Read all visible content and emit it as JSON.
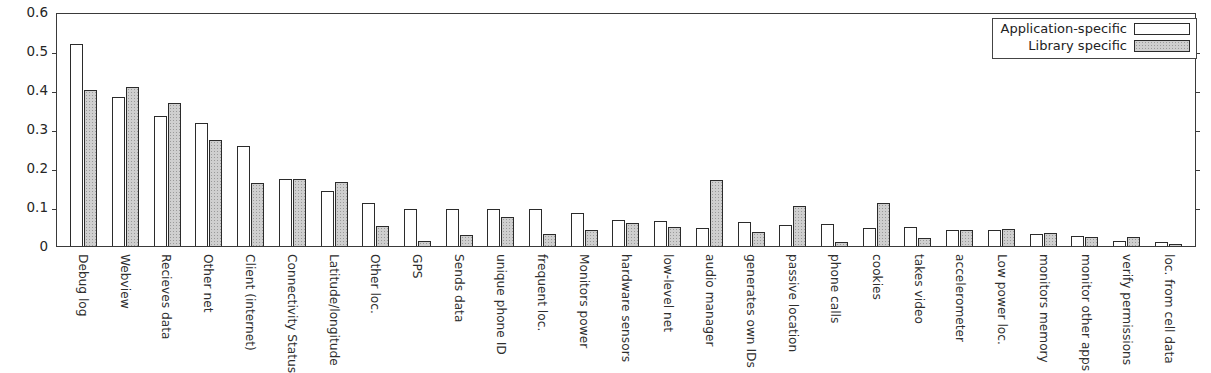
{
  "chart_data": {
    "type": "bar",
    "title": "",
    "subtitle": "",
    "xlabel": "",
    "ylabel": "",
    "ylim": [
      0,
      0.6
    ],
    "yticks": [
      "0",
      "0.1",
      "0.2",
      "0.3",
      "0.4",
      "0.5",
      "0.6"
    ],
    "ytick_values": [
      0,
      0.1,
      0.2,
      0.3,
      0.4,
      0.5,
      0.6
    ],
    "grid": false,
    "legend_position": "upper-right",
    "categories": [
      "Debug log",
      "Webview",
      "Recieves data",
      "Other net",
      "Client (internet)",
      "Connectivity Status",
      "Latitude/longitude",
      "Other loc.",
      "GPS",
      "Sends data",
      "unique phone ID",
      "frequent loc.",
      "Monitors power",
      "hardware sensors",
      "low-level net",
      "audio manager",
      "generates own IDs",
      "passive location",
      "phone calls",
      "cookies",
      "takes video",
      "accelerometer",
      "Low power loc.",
      "monitors memory",
      "monitor other apps",
      "verify permissions",
      "loc. from cell data"
    ],
    "series": [
      {
        "name": "Application-specific",
        "color": "#ffffff",
        "values": [
          0.517,
          0.383,
          0.334,
          0.315,
          0.256,
          0.172,
          0.141,
          0.111,
          0.096,
          0.095,
          0.094,
          0.094,
          0.085,
          0.067,
          0.064,
          0.047,
          0.062,
          0.053,
          0.056,
          0.047,
          0.05,
          0.042,
          0.04,
          0.031,
          0.026,
          0.014,
          0.01
        ]
      },
      {
        "name": "Library specific",
        "color": "#cfcfcf",
        "values": [
          0.401,
          0.409,
          0.367,
          0.272,
          0.161,
          0.172,
          0.163,
          0.052,
          0.014,
          0.029,
          0.075,
          0.03,
          0.04,
          0.06,
          0.049,
          0.168,
          0.036,
          0.103,
          0.011,
          0.11,
          0.021,
          0.04,
          0.044,
          0.034,
          0.022,
          0.023,
          0.006
        ]
      }
    ]
  },
  "legend": {
    "entries": [
      {
        "label": "Application-specific",
        "swatch": "app"
      },
      {
        "label": "Library specific",
        "swatch": "lib"
      }
    ]
  }
}
